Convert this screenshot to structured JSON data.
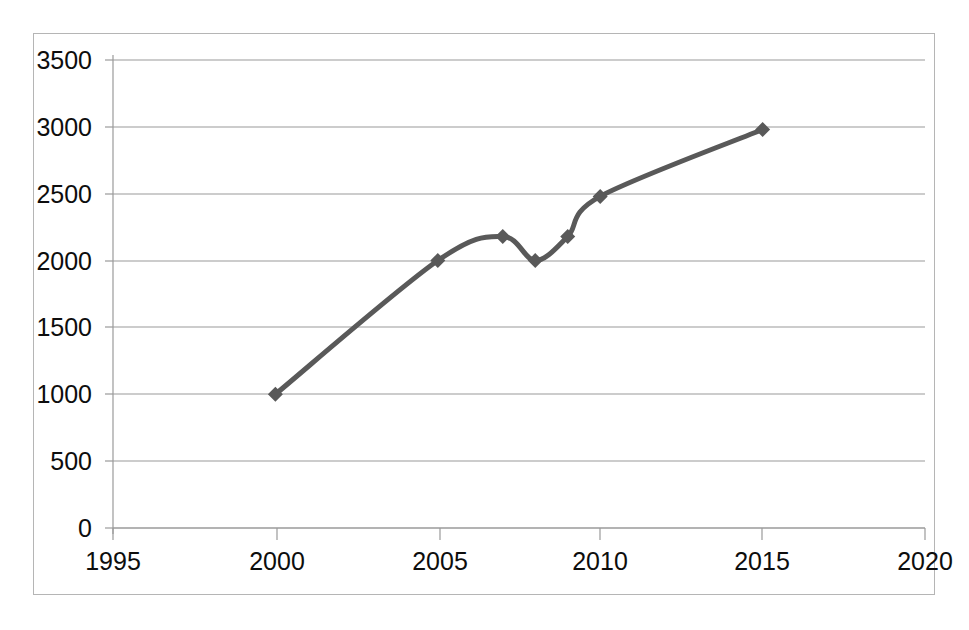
{
  "chart_data": {
    "type": "line",
    "title": "",
    "subtitle": "",
    "xlabel": "",
    "ylabel": "",
    "x": [
      2000,
      2005,
      2007,
      2008,
      2009,
      2010,
      2015
    ],
    "values": [
      1000,
      2000,
      2180,
      2000,
      2180,
      2480,
      2980
    ],
    "series": [
      {
        "name": "",
        "x": [
          2000,
          2005,
          2007,
          2008,
          2009,
          2010,
          2015
        ],
        "values": [
          1000,
          2000,
          2180,
          2000,
          2180,
          2480,
          2980
        ]
      }
    ],
    "xlim": [
      1995,
      2020
    ],
    "ylim": [
      0,
      3500
    ],
    "x_ticks": [
      1995,
      2000,
      2005,
      2010,
      2015,
      2020
    ],
    "x_tick_labels": [
      "1995",
      "2000",
      "2005",
      "2010",
      "2015",
      "2020"
    ],
    "y_ticks": [
      0,
      500,
      1000,
      1500,
      2000,
      2500,
      3000,
      3500
    ],
    "y_tick_labels": [
      "0",
      "500",
      "1000",
      "1500",
      "2000",
      "2500",
      "3000",
      "3500"
    ],
    "grid": true,
    "grid_axis": "y",
    "legend": false,
    "legend_position": "none",
    "smooth": true,
    "marker": "diamond",
    "annotations": []
  },
  "style": {
    "line_color": "#595959",
    "marker_color": "#595959",
    "grid_color": "#9a9a9a",
    "axis_color": "#9a9a9a",
    "text_color": "#0d0d0d",
    "border_color": "#b5b5b5",
    "plot_background": "#ffffff",
    "line_width": 5,
    "marker_size": 15
  }
}
